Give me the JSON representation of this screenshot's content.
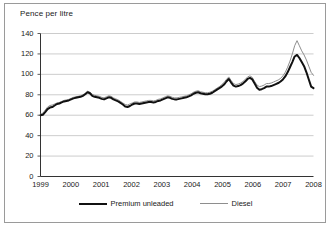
{
  "figure": {
    "axis_title": "Pence per litre"
  },
  "legend": {
    "position": "bottom-center",
    "items": [
      {
        "label": "Premium unleaded",
        "color": "#111111",
        "style": "thick-solid"
      },
      {
        "label": "Diesel",
        "color": "#8e8e8e",
        "style": "thin-solid"
      }
    ]
  },
  "chart_data": {
    "type": "line",
    "title": "",
    "subtitle": "",
    "xlabel": "",
    "ylabel": "Pence per litre",
    "ylim": [
      0,
      140
    ],
    "xlim": [
      1999,
      2008
    ],
    "grid": true,
    "y_ticks": [
      0,
      20,
      40,
      60,
      80,
      100,
      120,
      140
    ],
    "x_ticks": [
      "1999",
      "2000",
      "2001",
      "2002",
      "2003",
      "2004",
      "2005",
      "2006",
      "2007",
      "2008"
    ],
    "x_start": 1999.0,
    "x_step_years": 0.0833333,
    "series": [
      {
        "name": "Premium unleaded",
        "color": "#111111",
        "width": 2.0,
        "values": [
          60.0,
          60.5,
          63.0,
          66.0,
          67.5,
          68.0,
          69.5,
          71.0,
          71.5,
          72.5,
          73.5,
          74.0,
          74.5,
          75.5,
          76.5,
          77.0,
          77.5,
          78.0,
          79.0,
          80.5,
          82.5,
          81.5,
          79.0,
          78.0,
          77.5,
          77.0,
          76.0,
          75.5,
          76.5,
          77.5,
          77.0,
          75.5,
          74.5,
          73.5,
          72.0,
          70.5,
          68.5,
          68.0,
          69.0,
          70.5,
          71.5,
          71.5,
          71.0,
          71.5,
          72.0,
          72.5,
          73.0,
          73.0,
          72.5,
          73.0,
          74.0,
          74.5,
          75.5,
          76.5,
          77.5,
          77.0,
          76.0,
          75.5,
          75.5,
          76.0,
          76.5,
          77.0,
          77.5,
          78.5,
          79.5,
          81.0,
          82.0,
          82.5,
          81.5,
          81.0,
          80.5,
          80.5,
          81.0,
          82.0,
          83.5,
          85.0,
          86.5,
          88.0,
          90.0,
          93.0,
          95.5,
          92.0,
          89.0,
          88.0,
          88.5,
          89.5,
          91.0,
          93.0,
          95.5,
          96.5,
          95.0,
          91.0,
          87.0,
          85.0,
          85.5,
          86.5,
          88.0,
          88.0,
          88.5,
          89.5,
          90.5,
          91.5,
          93.0,
          95.0,
          98.0,
          102.0,
          107.0,
          112.0,
          117.5,
          119.0,
          116.0,
          112.0,
          108.0,
          102.0,
          95.0,
          88.0,
          86.5
        ]
      },
      {
        "name": "Diesel",
        "color": "#8e8e8e",
        "width": 1.0,
        "values": [
          61.0,
          62.0,
          65.0,
          68.0,
          69.5,
          70.0,
          71.0,
          72.0,
          72.5,
          73.5,
          74.5,
          75.0,
          75.5,
          76.5,
          77.5,
          78.0,
          78.5,
          79.0,
          80.0,
          81.5,
          83.5,
          82.5,
          80.5,
          79.5,
          79.0,
          78.5,
          77.5,
          77.0,
          78.0,
          79.0,
          78.5,
          77.0,
          76.0,
          75.0,
          73.5,
          72.0,
          70.5,
          70.0,
          71.0,
          72.0,
          73.0,
          73.0,
          72.5,
          73.0,
          73.5,
          74.0,
          74.5,
          74.5,
          74.0,
          74.5,
          75.5,
          76.0,
          77.0,
          78.0,
          79.0,
          78.5,
          77.5,
          77.0,
          77.0,
          77.5,
          78.0,
          78.5,
          79.0,
          80.0,
          81.0,
          82.5,
          83.5,
          84.0,
          83.0,
          82.5,
          82.0,
          82.0,
          82.5,
          83.5,
          85.0,
          86.5,
          88.0,
          90.0,
          92.0,
          95.0,
          97.5,
          94.0,
          91.0,
          90.0,
          90.5,
          91.5,
          93.0,
          95.0,
          97.5,
          98.5,
          97.0,
          93.0,
          89.5,
          88.0,
          88.5,
          89.5,
          91.0,
          91.0,
          91.5,
          92.5,
          93.5,
          94.5,
          96.0,
          98.5,
          102.0,
          107.0,
          113.0,
          120.0,
          128.0,
          133.0,
          128.0,
          123.0,
          119.0,
          114.0,
          108.0,
          102.0,
          99.0
        ]
      }
    ]
  }
}
